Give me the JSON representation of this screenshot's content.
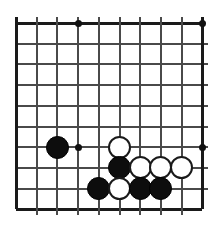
{
  "figure": {
    "board_type": "go-board",
    "background_color": "#ffffff",
    "line_color": "#4a4a4a",
    "edge_line_color": "#1a1a1a",
    "black_stone_color": "#0d0d0d",
    "white_stone_color": "#ffffff"
  },
  "board": {
    "columns": 10,
    "rows": 10,
    "origin_x": 16,
    "origin_y": 23,
    "spacing": 20.7,
    "line_overhang": 6,
    "stone_diameter": 23
  },
  "star_points": [
    {
      "name": "star-point-top",
      "col": 3,
      "row": 0
    },
    {
      "name": "star-point-top-right",
      "col": 9,
      "row": 0
    },
    {
      "name": "star-point-left",
      "col": 3,
      "row": 6
    },
    {
      "name": "star-point-right",
      "col": 9,
      "row": 6
    }
  ],
  "stones": [
    {
      "name": "black-stone-left",
      "color": "black",
      "col": 2,
      "row": 6
    },
    {
      "name": "white-stone-upper",
      "color": "white",
      "col": 5,
      "row": 6
    },
    {
      "name": "black-stone-middle",
      "color": "black",
      "col": 5,
      "row": 7
    },
    {
      "name": "white-stone-middle-a",
      "color": "white",
      "col": 6,
      "row": 7
    },
    {
      "name": "white-stone-middle-b",
      "color": "white",
      "col": 7,
      "row": 7
    },
    {
      "name": "white-stone-middle-c",
      "color": "white",
      "col": 8,
      "row": 7
    },
    {
      "name": "black-stone-bottom-a",
      "color": "black",
      "col": 4,
      "row": 8
    },
    {
      "name": "white-stone-bottom",
      "color": "white",
      "col": 5,
      "row": 8
    },
    {
      "name": "black-stone-bottom-b",
      "color": "black",
      "col": 6,
      "row": 8
    },
    {
      "name": "black-stone-bottom-c",
      "color": "black",
      "col": 7,
      "row": 8
    }
  ]
}
